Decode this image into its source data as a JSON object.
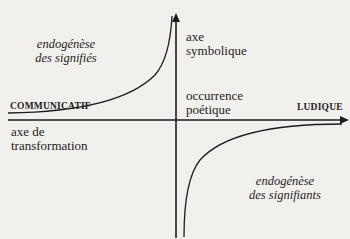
{
  "diagram": {
    "axes": {
      "horizontal": {
        "left_label": "COMMUNICATIF",
        "right_label": "LUDIQUE",
        "below_label": "axe de transformation"
      },
      "vertical": {
        "label": "axe symbolique"
      }
    },
    "labels": {
      "top_left": {
        "line1": "endogénèse",
        "line2": "des signifiés"
      },
      "bottom_right": {
        "line1": "endogénèse",
        "line2": "des signifiants"
      },
      "axe_de": "axe de",
      "transformation": "transformation",
      "axe": "axe",
      "symbolique": "symbolique",
      "occurrence": "occurrence",
      "poetique": "poétique",
      "communicatif": "COMMUNICATIF",
      "ludique": "LUDIQUE"
    },
    "colors": {
      "ink": "#1d1d1d",
      "paper": "#f1f0ed"
    }
  }
}
